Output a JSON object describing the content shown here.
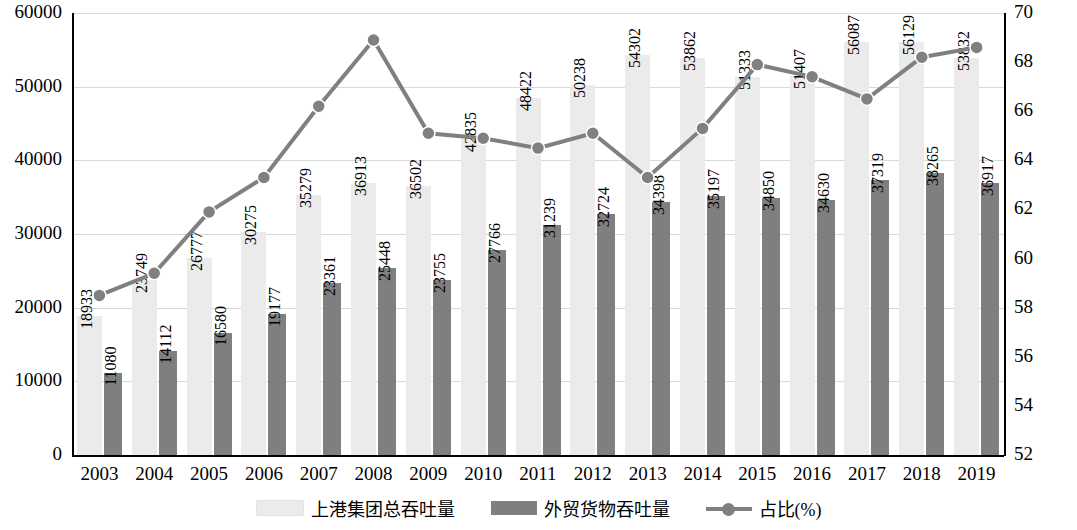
{
  "chart_data": {
    "type": "bar",
    "title": "",
    "xlabel": "",
    "ylabel": "",
    "categories": [
      "2003",
      "2004",
      "2005",
      "2006",
      "2007",
      "2008",
      "2009",
      "2010",
      "2011",
      "2012",
      "2013",
      "2014",
      "2015",
      "2016",
      "2017",
      "2018",
      "2019"
    ],
    "left_axis": {
      "min": 0,
      "max": 60000,
      "ticks": [
        "0",
        "10000",
        "20000",
        "30000",
        "40000",
        "50000",
        "60000"
      ]
    },
    "right_axis": {
      "min": 52,
      "max": 70,
      "ticks": [
        "52",
        "54",
        "56",
        "58",
        "60",
        "62",
        "64",
        "66",
        "68",
        "70"
      ]
    },
    "grid": true,
    "legend_position": "bottom",
    "series": [
      {
        "name": "上港集团总吞吐量",
        "type": "bar",
        "color": "#ebebeb",
        "axis": "left",
        "values": [
          18933,
          23749,
          26777,
          30275,
          35279,
          36913,
          36502,
          42835,
          48422,
          50238,
          54302,
          53862,
          51333,
          51407,
          56087,
          56129,
          53832
        ]
      },
      {
        "name": "外贸货物吞吐量",
        "type": "bar",
        "color": "#7f7f7f",
        "axis": "left",
        "values": [
          11080,
          14112,
          16580,
          19177,
          23361,
          25448,
          23755,
          27766,
          31239,
          32724,
          34398,
          35197,
          34850,
          34630,
          37319,
          38265,
          36917
        ]
      },
      {
        "name": "占比(%)",
        "type": "line",
        "color": "#808080",
        "axis": "right",
        "values": [
          58.5,
          59.4,
          61.9,
          63.3,
          66.2,
          68.9,
          65.1,
          64.9,
          64.5,
          65.1,
          63.3,
          65.3,
          67.9,
          67.4,
          66.5,
          68.2,
          68.6
        ]
      }
    ]
  },
  "legend": {
    "items": [
      {
        "label": "上港集团总吞吐量",
        "marker": "swatch-light"
      },
      {
        "label": "外贸货物吞吐量",
        "marker": "swatch-dark"
      },
      {
        "label": "占比(%)",
        "marker": "line-marker"
      }
    ]
  }
}
